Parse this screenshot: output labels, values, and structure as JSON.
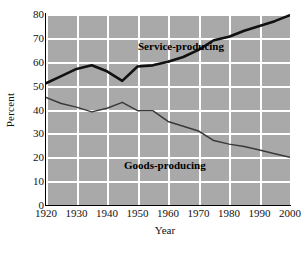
{
  "chart_data": {
    "type": "line",
    "title": "",
    "xlabel": "Year",
    "ylabel": "Percent",
    "xlim": [
      1920,
      2000
    ],
    "ylim": [
      0,
      80
    ],
    "xticks": [
      1920,
      1930,
      1940,
      1950,
      1960,
      1970,
      1980,
      1990,
      2000
    ],
    "yticks": [
      0,
      10,
      20,
      30,
      40,
      50,
      60,
      70,
      80
    ],
    "grid": true,
    "legend_position": "inline-annotations",
    "x": [
      1920,
      1925,
      1930,
      1935,
      1940,
      1945,
      1950,
      1955,
      1960,
      1965,
      1970,
      1975,
      1980,
      1985,
      1990,
      1995,
      2000
    ],
    "series": [
      {
        "name": "Service-producing",
        "color": "#111111",
        "line_width": 2.6,
        "values": [
          51,
          54,
          57,
          58.5,
          56,
          52,
          58,
          58.5,
          60,
          62,
          65,
          69,
          70.5,
          73,
          75,
          77,
          79.5
        ]
      },
      {
        "name": "Goods-producing",
        "color": "#3a3a3a",
        "line_width": 1.5,
        "values": [
          45,
          42.5,
          41,
          39,
          40.5,
          43,
          39.5,
          39.5,
          35,
          33,
          31,
          27,
          25.5,
          24.5,
          23,
          21.5,
          20
        ]
      }
    ],
    "annotations": [
      {
        "text": "Service-producing",
        "x": 1948,
        "y": 74
      },
      {
        "text": "Goods-producing",
        "x": 1943,
        "y": 27
      }
    ],
    "colors": {
      "plot_background": "#a9a9a9",
      "gridline": "#ffffff",
      "axis": "#000000",
      "page_background": "#ffffff",
      "text": "#111111"
    }
  },
  "axes": {
    "y_title": "Percent",
    "x_title": "Year",
    "y_tick_labels": [
      "0",
      "10",
      "20",
      "30",
      "40",
      "50",
      "60",
      "70",
      "80"
    ],
    "x_tick_labels": [
      "1920",
      "1930",
      "1940",
      "1950",
      "1960",
      "1970",
      "1980",
      "1990",
      "2000"
    ]
  }
}
